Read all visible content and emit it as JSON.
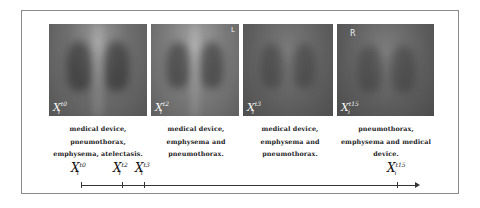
{
  "figure": {
    "panels": [
      {
        "label_base": "X",
        "label_sub": "i",
        "label_sup": "t0",
        "marker": "",
        "caption_lines": [
          "medical device,",
          "pneumothorax,",
          "emphysema, atelectasis."
        ]
      },
      {
        "label_base": "X",
        "label_sub": "i",
        "label_sup": "t2",
        "marker": "L",
        "caption_lines": [
          "medical device,",
          "emphysema and",
          "pneumothorax."
        ]
      },
      {
        "label_base": "X",
        "label_sub": "i",
        "label_sup": "t3",
        "marker": "",
        "caption_lines": [
          "medical device,",
          "emphysema and",
          "pneumothorax."
        ]
      },
      {
        "label_base": "X",
        "label_sub": "i",
        "label_sup": "t15",
        "marker": "R",
        "caption_lines": [
          "pneumothorax,",
          "emphysema and medical",
          "device."
        ]
      }
    ],
    "timeline": {
      "points": [
        {
          "base": "X",
          "sub": "i",
          "sup": "t0"
        },
        {
          "base": "X",
          "sub": "i",
          "sup": "t2"
        },
        {
          "base": "X",
          "sub": "i",
          "sup": "t3"
        },
        {
          "base": "X",
          "sub": "i",
          "sup": "t15"
        }
      ]
    }
  }
}
